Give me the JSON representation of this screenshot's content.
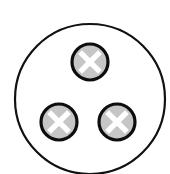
{
  "diagram": {
    "type": "socket-symbol",
    "background": "#ffffff",
    "outer_circle": {
      "cx": 90,
      "cy": 99,
      "r": 75,
      "stroke": "#111111",
      "stroke_width": 2.2,
      "fill": "#ffffff"
    },
    "pins": [
      {
        "id": "top",
        "cx": 90,
        "cy": 62,
        "r": 18,
        "fill": "#c6c6c6",
        "stroke": "#0d0d0d",
        "stroke_width": 3.2,
        "mark": "x",
        "mark_color": "#ffffff"
      },
      {
        "id": "bottom-left",
        "cx": 59,
        "cy": 122,
        "r": 18,
        "fill": "#c6c6c6",
        "stroke": "#0d0d0d",
        "stroke_width": 3.2,
        "mark": "x",
        "mark_color": "#ffffff"
      },
      {
        "id": "bottom-right",
        "cx": 117,
        "cy": 122,
        "r": 18,
        "fill": "#c6c6c6",
        "stroke": "#0d0d0d",
        "stroke_width": 3.2,
        "mark": "x",
        "mark_color": "#ffffff"
      }
    ]
  }
}
